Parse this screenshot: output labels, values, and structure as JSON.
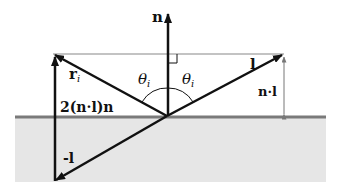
{
  "diagram": {
    "labels": {
      "normal": "n",
      "reflected_base": "r",
      "reflected_sub": "i",
      "theta_left_base": "θ",
      "theta_left_sub": "i",
      "theta_right_base": "θ",
      "theta_right_sub": "i",
      "light": "l",
      "n_dot_l": "n·l",
      "two_n_dot_l_n": "2(n·l)n",
      "neg_l": "-l"
    },
    "colors": {
      "surface_fill": "#e6e6e6",
      "surface_line": "#7a7a7a",
      "vector": "#111111",
      "guide_line": "#888888"
    }
  }
}
